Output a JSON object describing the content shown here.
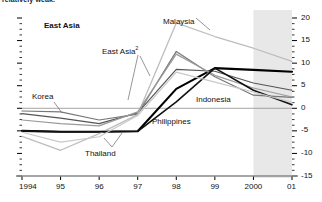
{
  "title": "relatively weak.",
  "chart_data": {
    "type": "line",
    "title": "relatively weak.",
    "xlabel": "",
    "ylabel": "",
    "x": [
      "1994",
      "95",
      "96",
      "97",
      "98",
      "99",
      "2000",
      "01"
    ],
    "x_tick_labels": [
      "1994",
      "95",
      "96",
      "97",
      "98",
      "99",
      "2000",
      "01"
    ],
    "y_tick_labels": [
      "20",
      "15",
      "10",
      "5",
      "0",
      "-5",
      "-10",
      "-15"
    ],
    "y_ticks": [
      20,
      15,
      10,
      5,
      0,
      -5,
      -10,
      -15
    ],
    "ylim": [
      -15,
      20
    ],
    "grid": false,
    "zero_line": 0,
    "legend": "inline-labels",
    "axis_side": "right",
    "shaded_region": {
      "from": "2000",
      "to": "01",
      "label": "forecast",
      "color": "#e8e8e8"
    },
    "series": [
      {
        "name": "East Asia",
        "color": "#000000",
        "width": 2.1,
        "values": [
          -5.0,
          -5.2,
          -5.2,
          -5.1,
          4.3,
          8.9,
          8.5,
          8.1
        ]
      },
      {
        "name": "East Asia2",
        "color": "#555555",
        "width": 1.2,
        "values": [
          -1.2,
          -2.2,
          -3.4,
          -1.0,
          8.6,
          8.2,
          5.6,
          4.0
        ]
      },
      {
        "name": "Korea",
        "color": "#777777",
        "width": 1.2,
        "values": [
          -0.6,
          -0.8,
          -2.6,
          -1.3,
          12.6,
          7.0,
          2.9,
          2.4
        ]
      },
      {
        "name": "Malaysia",
        "color": "#bdbdbd",
        "width": 1.3,
        "values": [
          -6.2,
          -9.3,
          -5.6,
          -1.4,
          18.9,
          15.9,
          13.3,
          10.4
        ]
      },
      {
        "name": "Indonesia",
        "color": "#9a9a9a",
        "width": 1.2,
        "values": [
          -2.6,
          -3.4,
          -3.9,
          -0.8,
          12.0,
          7.3,
          4.5,
          2.5
        ]
      },
      {
        "name": "Philippines",
        "color": "#111111",
        "width": 1.6,
        "values": [
          -5.0,
          -5.2,
          -5.2,
          -5.1,
          1.4,
          8.9,
          4.0,
          0.8
        ]
      },
      {
        "name": "Thailand",
        "color": "#c9c9c9",
        "width": 1.2,
        "values": [
          -5.3,
          -7.5,
          -6.3,
          -1.6,
          8.0,
          5.8,
          3.6,
          1.3
        ]
      }
    ],
    "annotations": [
      {
        "text": "East Asia",
        "bold": true,
        "x": 44,
        "y": 22
      },
      {
        "text": "Malaysia",
        "bold": false,
        "x": 163,
        "y": 18
      },
      {
        "text": "East Asia",
        "sup": "2",
        "bold": false,
        "x": 102,
        "y": 46
      },
      {
        "text": "Korea",
        "bold": false,
        "x": 32,
        "y": 93
      },
      {
        "text": "Indonesia",
        "bold": false,
        "x": 196,
        "y": 96
      },
      {
        "text": "Philippines",
        "bold": false,
        "x": 152,
        "y": 118
      },
      {
        "text": "Thailand",
        "bold": false,
        "x": 85,
        "y": 150
      }
    ]
  }
}
